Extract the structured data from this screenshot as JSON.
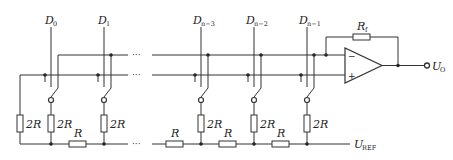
{
  "diagram": {
    "type": "R-2R ladder D/A converter (inverted ladder)",
    "inputs": [
      {
        "name": "D",
        "sub": "0",
        "x": 51
      },
      {
        "name": "D",
        "sub": "1",
        "x": 104
      },
      {
        "name": "D",
        "sub": "n−3",
        "x": 201
      },
      {
        "name": "D",
        "sub": "n−2",
        "x": 254
      },
      {
        "name": "D",
        "sub": "n−1",
        "x": 307
      }
    ],
    "ellipsis": "···",
    "resistors": {
      "shunt_label": "2R",
      "series_label": "R",
      "feedback_name": "R",
      "feedback_sub": "f"
    },
    "opamp": {
      "minus": "−",
      "plus": "+"
    },
    "output": {
      "name": "U",
      "sub": "O"
    },
    "reference": {
      "name": "U",
      "sub": "REF"
    }
  }
}
